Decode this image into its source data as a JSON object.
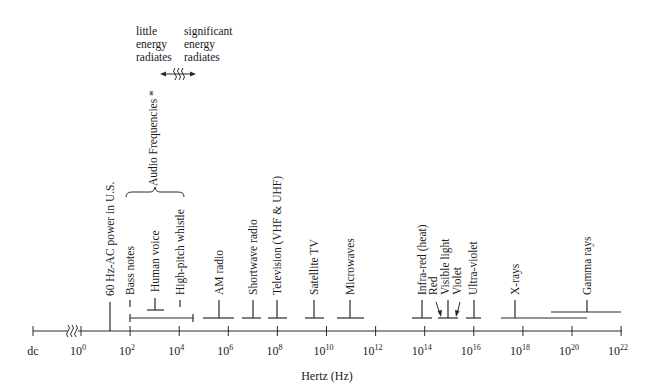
{
  "diagram": {
    "axis": {
      "label": "Hertz (Hz)",
      "dc_label": "dc",
      "ticks": [
        {
          "base": "10",
          "exp": "0",
          "value_exp": 0
        },
        {
          "base": "10",
          "exp": "2",
          "value_exp": 2
        },
        {
          "base": "10",
          "exp": "4",
          "value_exp": 4
        },
        {
          "base": "10",
          "exp": "6",
          "value_exp": 6
        },
        {
          "base": "10",
          "exp": "8",
          "value_exp": 8
        },
        {
          "base": "10",
          "exp": "10",
          "value_exp": 10
        },
        {
          "base": "10",
          "exp": "12",
          "value_exp": 12
        },
        {
          "base": "10",
          "exp": "14",
          "value_exp": 14
        },
        {
          "base": "10",
          "exp": "16",
          "value_exp": 16
        },
        {
          "base": "10",
          "exp": "18",
          "value_exp": 18
        },
        {
          "base": "10",
          "exp": "20",
          "value_exp": 20
        },
        {
          "base": "10",
          "exp": "22",
          "value_exp": 22
        }
      ]
    },
    "energy_note": {
      "left": [
        "little",
        "energy",
        "radiates"
      ],
      "right": [
        "significant",
        "energy",
        "radiates"
      ]
    },
    "audio_group_label": "Audio Frequencies *",
    "bands": [
      {
        "label": "60 Hz-AC power in U.S.",
        "log_center": 1.78
      },
      {
        "label": "Bass notes",
        "log_center": 2.0
      },
      {
        "label": "Human voice",
        "log_center": 3.0,
        "log_from": 2.7,
        "log_to": 3.4
      },
      {
        "label": "High-pitch whistle",
        "log_center": 4.0
      },
      {
        "label": "Audio range",
        "log_from": 2.0,
        "log_to": 4.5
      },
      {
        "label": "AM radio",
        "log_center": 5.6,
        "log_from": 4.9,
        "log_to": 6.5
      },
      {
        "label": "Shortwave radio",
        "log_center": 7.0,
        "log_from": 6.5,
        "log_to": 7.3
      },
      {
        "label": "Television (VHF & UHF)",
        "log_center": 8.0,
        "log_from": 7.6,
        "log_to": 8.4
      },
      {
        "label": "Satellite TV",
        "log_center": 9.5,
        "log_from": 9.2,
        "log_to": 10.0
      },
      {
        "label": "Microwaves",
        "log_center": 11.0,
        "log_from": 10.5,
        "log_to": 11.5
      },
      {
        "label": "Infra-red (heat)",
        "log_center": 13.9,
        "log_from": 13.5,
        "log_to": 14.3
      },
      {
        "label": "Red",
        "log_center": 14.6
      },
      {
        "label": "Visible light",
        "log_center": 14.9,
        "log_from": 14.55,
        "log_to": 15.35
      },
      {
        "label": "Violet",
        "log_center": 15.2
      },
      {
        "label": "Ultra-violet",
        "log_center": 16.0,
        "log_from": 15.7,
        "log_to": 16.3
      },
      {
        "label": "X-rays",
        "log_center": 17.7,
        "log_from": 17.1,
        "log_to": 20.6
      },
      {
        "label": "Gamma rays",
        "log_center": 20.6,
        "log_from": 19.1,
        "log_to": 22.0
      }
    ]
  }
}
